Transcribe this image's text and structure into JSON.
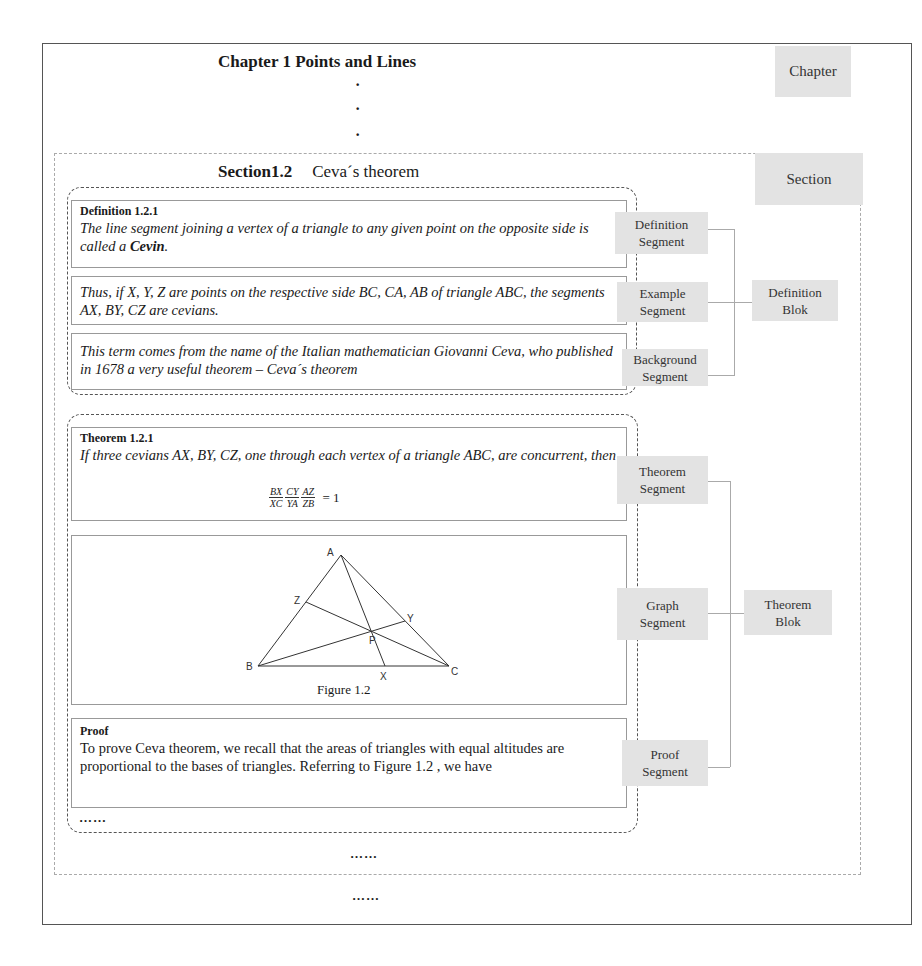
{
  "chapter": {
    "title": "Chapter 1  Points and Lines",
    "label": "Chapter",
    "dots": [
      "·",
      "·",
      "·"
    ]
  },
  "section": {
    "number": "Section1.2",
    "name": "Ceva´s theorem",
    "label": "Section",
    "ellipsis": "……",
    "after_ellipsis": "……"
  },
  "definition_block": {
    "label": "Definition\nBlok",
    "label_lines": [
      "Definition",
      "Blok"
    ],
    "segments": [
      {
        "label_lines": [
          "Definition",
          "Segment"
        ],
        "heading": "Definition 1.2.1",
        "text_before": "The line segment joining a vertex of a triangle to any given point on the opposite side is called a ",
        "text_bold": "Cevin",
        "text_after": "."
      },
      {
        "label_lines": [
          "Example",
          "Segment"
        ],
        "text": "Thus, if X, Y, Z are points on the respective side BC, CA, AB of triangle ABC, the segments AX, BY, CZ are cevians."
      },
      {
        "label_lines": [
          "Background",
          "Segment"
        ],
        "text": "This term comes from the name of the Italian mathematician Giovanni Ceva, who published in 1678 a very useful theorem  – Ceva´s  theorem"
      }
    ]
  },
  "theorem_block": {
    "label_lines": [
      "Theorem",
      "Blok"
    ],
    "segments": [
      {
        "label_lines": [
          "Theorem",
          "Segment"
        ],
        "heading": "Theorem 1.2.1",
        "text": "If three cevians AX, BY, CZ, one through each vertex of a triangle ABC, are concurrent, then",
        "formula": {
          "fractions": [
            [
              "BX",
              "XC"
            ],
            [
              "CY",
              "YA"
            ],
            [
              "AZ",
              "ZB"
            ]
          ],
          "rhs": "= 1"
        }
      },
      {
        "label_lines": [
          "Graph",
          "Segment"
        ],
        "figure": {
          "caption": "Figure 1.2",
          "points": {
            "A": "A",
            "B": "B",
            "C": "C",
            "X": "X",
            "Y": "Y",
            "Z": "Z",
            "P": "P"
          }
        }
      },
      {
        "label_lines": [
          "Proof",
          "Segment"
        ],
        "heading": "Proof",
        "text": "To prove Ceva theorem, we recall that the areas of triangles with equal altitudes are proportional to the bases of triangles. Referring to Figure 1.2 , we have",
        "ellipsis": "……"
      }
    ]
  },
  "colors": {
    "label_bg": "#e3e3e3",
    "border": "#555555",
    "connector": "#aaaaaa"
  }
}
